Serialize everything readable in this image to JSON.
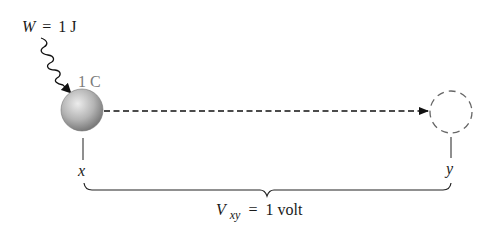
{
  "figure": {
    "kind": "electric potential difference illustration",
    "work_label": {
      "symbol": "W",
      "equals": "=",
      "value": "1 J"
    },
    "charge_label": "1 C",
    "point_x_label": "x",
    "point_y_label": "y",
    "voltage_label": {
      "symbol": "V",
      "subscript": "xy",
      "equals": "=",
      "value": "1 volt"
    },
    "colors": {
      "text": "#1a1a1a",
      "gray_text": "#7a7a7a",
      "line": "#222222",
      "dashed_circle": "#666666",
      "sphere_light": "#e6e6e6",
      "sphere_dark": "#7d7d7d"
    }
  }
}
